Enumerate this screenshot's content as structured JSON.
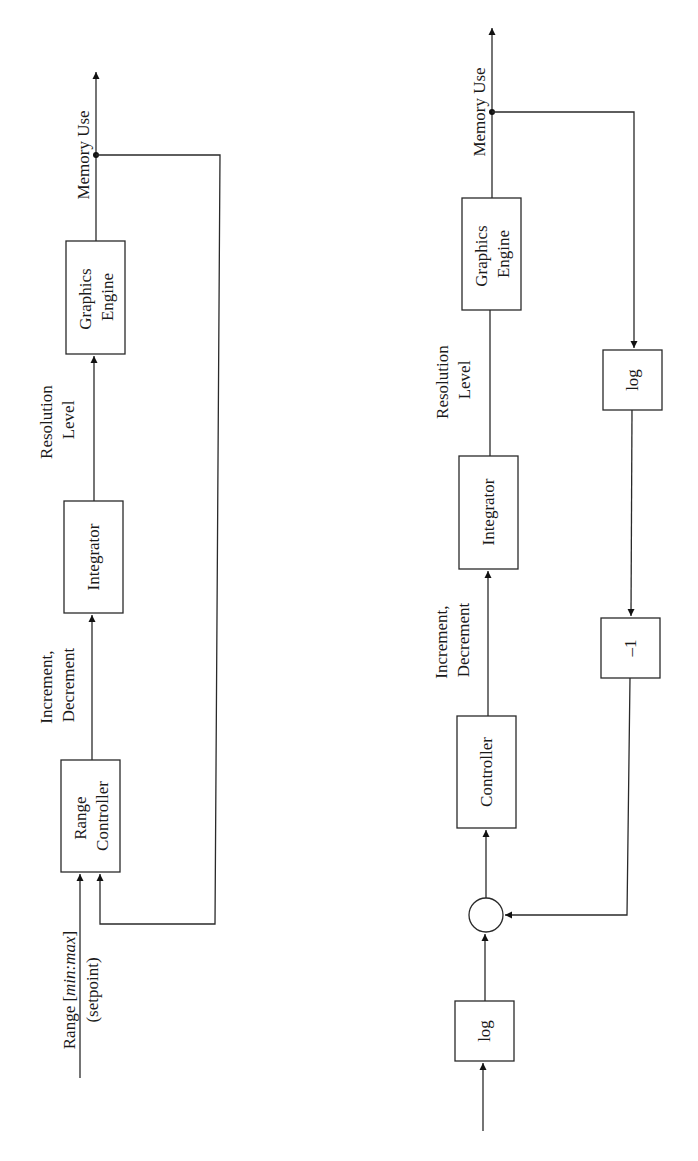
{
  "diagrams": [
    {
      "id": "left",
      "blocks": [
        {
          "name": "graphics-engine",
          "lines": [
            "Graphics",
            "Engine"
          ]
        },
        {
          "name": "integrator",
          "lines": [
            "Integrator"
          ]
        },
        {
          "name": "range-controller",
          "lines": [
            "Range",
            "Controller"
          ]
        }
      ],
      "signals": {
        "output": "Memory Use",
        "resolution": [
          "Resolution",
          "Level"
        ],
        "increment": [
          "Increment,",
          "Decrement"
        ],
        "setpoint_range": "Range [",
        "setpoint_minmax": "min:max",
        "setpoint_close": "]",
        "setpoint_sub": "(setpoint)"
      }
    },
    {
      "id": "right",
      "blocks": [
        {
          "name": "graphics-engine",
          "lines": [
            "Graphics",
            "Engine"
          ]
        },
        {
          "name": "integrator",
          "lines": [
            "Integrator"
          ]
        },
        {
          "name": "controller",
          "lines": [
            "Controller"
          ]
        },
        {
          "name": "log-input",
          "lines": [
            "log"
          ]
        },
        {
          "name": "log-feedback",
          "lines": [
            "log"
          ]
        },
        {
          "name": "negate",
          "lines": [
            "–1"
          ]
        }
      ],
      "signals": {
        "output": "Memory Use",
        "resolution": [
          "Resolution",
          "Level"
        ],
        "increment": [
          "Increment,",
          "Decrement"
        ]
      }
    }
  ]
}
